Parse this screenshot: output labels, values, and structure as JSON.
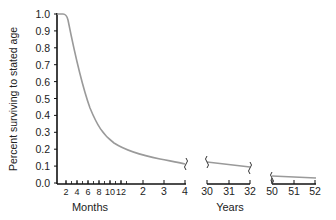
{
  "chart_data": {
    "type": "line",
    "title": "",
    "ylabel": "Percent surviving to stated age",
    "ylim": [
      0.0,
      1.0
    ],
    "yticks": [
      "0.0",
      "0.1",
      "0.2",
      "0.3",
      "0.4",
      "0.5",
      "0.6",
      "0.7",
      "0.8",
      "0.9",
      "1.0"
    ],
    "grid": false,
    "legend": null,
    "segments": [
      {
        "name": "early",
        "xlabel": "Months",
        "tick_labels": [
          "2",
          "4",
          "6",
          "8",
          "10",
          "12",
          "2",
          "3",
          "4"
        ],
        "note": "First six ticks in months, then years 2, 3, 4",
        "x": [
          "0mo",
          "1mo",
          "2mo",
          "4mo",
          "6mo",
          "8mo",
          "10mo",
          "12mo",
          "2yr",
          "3yr",
          "4yr"
        ],
        "values": [
          1.0,
          0.99,
          0.9,
          0.7,
          0.55,
          0.44,
          0.4,
          0.37,
          0.3,
          0.26,
          0.22
        ]
      },
      {
        "name": "middle",
        "xlabel": "Years",
        "tick_labels": [
          "30",
          "31",
          "32"
        ],
        "x": [
          30,
          31,
          32
        ],
        "values": [
          0.12,
          0.11,
          0.1
        ]
      },
      {
        "name": "late",
        "xlabel": "",
        "tick_labels": [
          "50",
          "51",
          "52"
        ],
        "x": [
          50,
          51,
          52
        ],
        "values": [
          0.05,
          0.045,
          0.04
        ]
      }
    ],
    "axis_break_symbol": "~",
    "colors": {
      "curve": "#9a9a9a",
      "axis": "#111111",
      "text": "#222222"
    }
  }
}
